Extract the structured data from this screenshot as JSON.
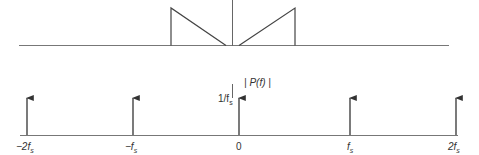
{
  "diagram": {
    "top_panel": {
      "shapes": [
        "left triangular spectrum portion",
        "right triangular spectrum portion"
      ],
      "center_line": true
    },
    "bottom_panel": {
      "ylabel": "| P(f) |",
      "impulse_height_label": "1/f",
      "impulse_height_subscript": "s",
      "ticks": [
        {
          "main": "−2f",
          "sub": "s"
        },
        {
          "main": "−f",
          "sub": "s"
        },
        {
          "main": "0",
          "sub": ""
        },
        {
          "main": "f",
          "sub": "s"
        },
        {
          "main": "2f",
          "sub": "s"
        }
      ]
    },
    "colors": {
      "line": "#444444",
      "axis": "#777777",
      "text": "#333333"
    }
  }
}
